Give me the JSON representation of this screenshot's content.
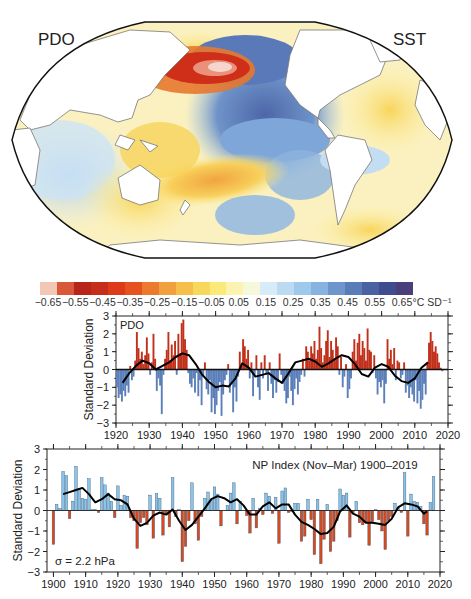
{
  "map": {
    "left_label": "PDO",
    "right_label": "SST",
    "projection": "Robinson-like world map, Pacific-centered"
  },
  "colorbar": {
    "ticks": [
      "-0.65",
      "-0.55",
      "-0.45",
      "-0.35",
      "-0.25",
      "-0.15",
      "-0.05",
      "0.05",
      "0.15",
      "0.25",
      "0.35",
      "0.45",
      "0.55",
      "0.65"
    ],
    "unit": "°C SD⁻¹",
    "colors": [
      "#f2c7b4",
      "#d9583a",
      "#b8231a",
      "#c42e1a",
      "#dd3a1a",
      "#e5511f",
      "#ec7a2e",
      "#f2a03f",
      "#f6bf4c",
      "#f8d85c",
      "#fbe97a",
      "#fcf3b0",
      "#f6f8dc",
      "#d8ebf8",
      "#bcdaf2",
      "#9ec8ec",
      "#86b3e0",
      "#6e96cc",
      "#5a7cb8",
      "#4a62a2",
      "#3f4d8e",
      "#4a3f7a"
    ]
  },
  "chart_data": [
    {
      "type": "bar",
      "title": "PDO",
      "xlabel": "",
      "ylabel": "Standard Deviation",
      "xlim": [
        1920,
        2020
      ],
      "ylim": [
        -3,
        3
      ],
      "xticks": [
        "1920",
        "1930",
        "1940",
        "1950",
        "1960",
        "1970",
        "1980",
        "1990",
        "2000",
        "2010",
        "2020"
      ],
      "yticks": [
        "-3",
        "-2",
        "-1",
        "0",
        "1",
        "2",
        "3"
      ],
      "positive_color": "#c0301a",
      "negative_color": "#5b7fb8",
      "note": "monthly bars approximated at ~quarterly resolution",
      "x": [
        1920.0,
        1920.5,
        1921.0,
        1921.5,
        1922.0,
        1922.5,
        1923.0,
        1923.5,
        1924.0,
        1924.5,
        1925.0,
        1925.5,
        1926.0,
        1926.5,
        1927.0,
        1927.5,
        1928.0,
        1928.5,
        1929.0,
        1929.5,
        1930.0,
        1930.5,
        1931.0,
        1931.5,
        1932.0,
        1932.5,
        1933.0,
        1933.5,
        1934.0,
        1934.5,
        1935.0,
        1935.5,
        1936.0,
        1936.5,
        1937.0,
        1937.5,
        1938.0,
        1938.5,
        1939.0,
        1939.5,
        1940.0,
        1940.5,
        1941.0,
        1941.5,
        1942.0,
        1942.5,
        1943.0,
        1943.5,
        1944.0,
        1944.5,
        1945.0,
        1945.5,
        1946.0,
        1946.5,
        1947.0,
        1947.5,
        1948.0,
        1948.5,
        1949.0,
        1949.5,
        1950.0,
        1950.5,
        1951.0,
        1951.5,
        1952.0,
        1952.5,
        1953.0,
        1953.5,
        1954.0,
        1954.5,
        1955.0,
        1955.5,
        1956.0,
        1956.5,
        1957.0,
        1957.5,
        1958.0,
        1958.5,
        1959.0,
        1959.5,
        1960.0,
        1960.5,
        1961.0,
        1961.5,
        1962.0,
        1962.5,
        1963.0,
        1963.5,
        1964.0,
        1964.5,
        1965.0,
        1965.5,
        1966.0,
        1966.5,
        1967.0,
        1967.5,
        1968.0,
        1968.5,
        1969.0,
        1969.5,
        1970.0,
        1970.5,
        1971.0,
        1971.5,
        1972.0,
        1972.5,
        1973.0,
        1973.5,
        1974.0,
        1974.5,
        1975.0,
        1975.5,
        1976.0,
        1976.5,
        1977.0,
        1977.5,
        1978.0,
        1978.5,
        1979.0,
        1979.5,
        1980.0,
        1980.5,
        1981.0,
        1981.5,
        1982.0,
        1982.5,
        1983.0,
        1983.5,
        1984.0,
        1984.5,
        1985.0,
        1985.5,
        1986.0,
        1986.5,
        1987.0,
        1987.5,
        1988.0,
        1988.5,
        1989.0,
        1989.5,
        1990.0,
        1990.5,
        1991.0,
        1991.5,
        1992.0,
        1992.5,
        1993.0,
        1993.5,
        1994.0,
        1994.5,
        1995.0,
        1995.5,
        1996.0,
        1996.5,
        1997.0,
        1997.5,
        1998.0,
        1998.5,
        1999.0,
        1999.5,
        2000.0,
        2000.5,
        2001.0,
        2001.5,
        2002.0,
        2002.5,
        2003.0,
        2003.5,
        2004.0,
        2004.5,
        2005.0,
        2005.5,
        2006.0,
        2006.5,
        2007.0,
        2007.5,
        2008.0,
        2008.5,
        2009.0,
        2009.5,
        2010.0,
        2010.5,
        2011.0,
        2011.5,
        2012.0,
        2012.5,
        2013.0,
        2013.5,
        2014.0,
        2014.5,
        2015.0,
        2015.5,
        2016.0,
        2016.5,
        2017.0,
        2017.5,
        2018.0,
        2018.5
      ],
      "values": [
        -1.0,
        -1.6,
        -1.4,
        -1.8,
        -1.2,
        -1.5,
        -0.9,
        -1.3,
        0.2,
        -0.6,
        -0.4,
        0.5,
        2.1,
        1.2,
        0.6,
        1.0,
        0.3,
        0.8,
        1.8,
        0.9,
        -0.3,
        0.4,
        2.0,
        0.6,
        -1.2,
        -0.5,
        -0.9,
        -2.5,
        -0.3,
        0.6,
        1.1,
        2.1,
        0.5,
        1.4,
        0.8,
        1.6,
        -0.3,
        2.0,
        0.9,
        2.6,
        2.8,
        1.7,
        1.1,
        -0.2,
        -0.8,
        -1.0,
        -0.5,
        -1.3,
        -0.2,
        -1.5,
        -0.6,
        -2.0,
        -0.4,
        0.4,
        -1.1,
        -1.4,
        -0.6,
        -2.4,
        -1.6,
        -2.5,
        -2.0,
        -1.2,
        -0.7,
        -2.6,
        -1.4,
        -0.6,
        -0.3,
        0.3,
        -1.3,
        -0.8,
        -2.4,
        -1.0,
        -1.8,
        -0.4,
        1.0,
        0.3,
        1.7,
        1.3,
        0.6,
        1.1,
        -0.5,
        0.4,
        -1.5,
        -0.3,
        0.8,
        -1.0,
        -1.7,
        0.4,
        -0.5,
        0.8,
        -0.3,
        -1.2,
        0.4,
        -0.8,
        -1.6,
        -0.6,
        -1.3,
        -0.7,
        0.9,
        -0.3,
        -0.8,
        -1.2,
        -1.9,
        -1.6,
        -0.4,
        -1.2,
        -2.0,
        -1.1,
        -0.5,
        -1.4,
        -0.7,
        -0.3,
        0.6,
        -0.4,
        1.3,
        1.0,
        0.5,
        1.3,
        0.9,
        1.6,
        0.6,
        1.1,
        2.4,
        1.2,
        0.4,
        0.8,
        1.6,
        2.2,
        0.7,
        1.6,
        1.1,
        0.6,
        1.8,
        1.3,
        -0.3,
        0.7,
        -1.0,
        -0.4,
        0.3,
        -1.6,
        -1.1,
        -0.5,
        1.0,
        1.7,
        0.5,
        1.5,
        2.0,
        0.8,
        1.6,
        1.2,
        0.5,
        2.3,
        1.1,
        1.0,
        -0.2,
        0.8,
        -0.5,
        -1.4,
        -0.7,
        -1.0,
        -0.6,
        -1.9,
        -0.8,
        1.7,
        0.6,
        1.1,
        0.3,
        1.2,
        -0.6,
        0.5,
        0.4,
        -0.5,
        -0.3,
        0.4,
        -1.3,
        -0.9,
        -1.6,
        -1.0,
        -1.4,
        -1.8,
        -0.6,
        -1.9,
        -1.2,
        -2.2,
        -1.7,
        -0.8,
        -1.4,
        0.4,
        1.5,
        2.1,
        1.6,
        1.0,
        1.3,
        0.9,
        0.4,
        0.1,
        -0.1
      ],
      "smooth": {
        "x": [
          1922,
          1924,
          1926,
          1928,
          1930,
          1932,
          1934,
          1936,
          1938,
          1940,
          1942,
          1944,
          1946,
          1948,
          1950,
          1952,
          1954,
          1956,
          1958,
          1960,
          1962,
          1964,
          1966,
          1968,
          1970,
          1972,
          1974,
          1976,
          1978,
          1980,
          1982,
          1984,
          1986,
          1988,
          1990,
          1992,
          1994,
          1996,
          1998,
          2000,
          2002,
          2004,
          2006,
          2008,
          2010,
          2012,
          2014
        ],
        "values": [
          -0.75,
          -0.2,
          0.2,
          0.5,
          0.35,
          0.0,
          0.2,
          0.4,
          0.7,
          0.9,
          0.8,
          0.3,
          -0.3,
          -0.7,
          -1.0,
          -0.9,
          -0.95,
          -0.5,
          0.35,
          0.1,
          -0.4,
          -0.3,
          -0.2,
          -0.5,
          -0.75,
          -0.2,
          0.4,
          0.5,
          0.6,
          0.45,
          0.15,
          0.35,
          0.6,
          0.8,
          0.7,
          0.3,
          -0.25,
          -0.4,
          0.1,
          0.3,
          0.15,
          -0.35,
          -0.65,
          -0.75,
          -0.5,
          0.1,
          0.4
        ]
      }
    },
    {
      "type": "bar",
      "title": "NP Index (Nov-Mar) 1900-2019",
      "xlabel": "",
      "ylabel": "Standard Deviation",
      "annotation": "σ = 2.2 hPa",
      "xlim": [
        1898,
        2020
      ],
      "ylim": [
        -3,
        3
      ],
      "xticks": [
        "1900",
        "1910",
        "1920",
        "1930",
        "1940",
        "1950",
        "1960",
        "1970",
        "1980",
        "1990",
        "2000",
        "2010",
        "2020"
      ],
      "yticks": [
        "-3",
        "-2",
        "-1",
        "0",
        "1",
        "2",
        "3"
      ],
      "positive_color": "#8cc3e8",
      "negative_color": "#d9491c",
      "x": [
        1900,
        1901,
        1902,
        1903,
        1904,
        1905,
        1906,
        1907,
        1908,
        1909,
        1910,
        1911,
        1912,
        1913,
        1914,
        1915,
        1916,
        1917,
        1918,
        1919,
        1920,
        1921,
        1922,
        1923,
        1924,
        1925,
        1926,
        1927,
        1928,
        1929,
        1930,
        1931,
        1932,
        1933,
        1934,
        1935,
        1936,
        1937,
        1938,
        1939,
        1940,
        1941,
        1942,
        1943,
        1944,
        1945,
        1946,
        1947,
        1948,
        1949,
        1950,
        1951,
        1952,
        1953,
        1954,
        1955,
        1956,
        1957,
        1958,
        1959,
        1960,
        1961,
        1962,
        1963,
        1964,
        1965,
        1966,
        1967,
        1968,
        1969,
        1970,
        1971,
        1972,
        1973,
        1974,
        1975,
        1976,
        1977,
        1978,
        1979,
        1980,
        1981,
        1982,
        1983,
        1984,
        1985,
        1986,
        1987,
        1988,
        1989,
        1990,
        1991,
        1992,
        1993,
        1994,
        1995,
        1996,
        1997,
        1998,
        1999,
        2000,
        2001,
        2002,
        2003,
        2004,
        2005,
        2006,
        2007,
        2008,
        2009,
        2010,
        2011,
        2012,
        2013,
        2014,
        2015,
        2016,
        2017,
        2018,
        2019
      ],
      "values": [
        -1.65,
        0.3,
        0.1,
        1.9,
        1.7,
        -0.4,
        0.45,
        2.15,
        1.05,
        0.6,
        0.55,
        1.55,
        0.05,
        0.05,
        -0.1,
        1.6,
        1.25,
        0.85,
        0.45,
        -0.35,
        1.2,
        0.25,
        0.75,
        0.7,
        -0.35,
        -0.5,
        -1.85,
        -0.6,
        -0.35,
        -0.7,
        0.75,
        -1.35,
        0.82,
        0.6,
        -1.2,
        -0.15,
        -0.8,
        1.6,
        -0.3,
        0.05,
        -2.5,
        -1.75,
        -0.5,
        1.35,
        -0.65,
        -1.45,
        -0.3,
        0.6,
        0.9,
        0.5,
        1.15,
        0.8,
        -0.75,
        0.0,
        0.25,
        0.85,
        1.35,
        -0.65,
        0.45,
        0.0,
        -0.25,
        -1.1,
        0.6,
        -0.85,
        0.1,
        -0.2,
        0.85,
        0.7,
        -0.15,
        0.65,
        -1.6,
        0.95,
        1.1,
        -0.1,
        -0.05,
        0.35,
        0.35,
        -1.5,
        -1.25,
        0.55,
        -0.45,
        -2.15,
        0.55,
        -2.6,
        -1.4,
        0.3,
        -2.0,
        -1.5,
        -0.5,
        1.05,
        0.75,
        0.85,
        -1.3,
        -0.1,
        0.45,
        -0.6,
        -0.7,
        -0.6,
        -1.7,
        -0.55,
        0.05,
        -0.45,
        -1.0,
        -1.9,
        -0.5,
        -0.3,
        0.35,
        0.1,
        -0.1,
        1.85,
        -1.25,
        0.8,
        0.45,
        0.4,
        0.2,
        -0.65,
        -1.2,
        0.4,
        1.65,
        0.0
      ],
      "smooth": {
        "x": [
          1903,
          1905,
          1907,
          1909,
          1911,
          1913,
          1915,
          1917,
          1919,
          1921,
          1923,
          1925,
          1927,
          1929,
          1931,
          1933,
          1935,
          1937,
          1939,
          1941,
          1943,
          1945,
          1947,
          1949,
          1951,
          1953,
          1955,
          1957,
          1959,
          1961,
          1963,
          1965,
          1967,
          1969,
          1971,
          1973,
          1975,
          1977,
          1979,
          1981,
          1983,
          1985,
          1987,
          1989,
          1991,
          1993,
          1995,
          1997,
          1999,
          2001,
          2003,
          2005,
          2007,
          2009,
          2011,
          2013,
          2015,
          2016
        ],
        "values": [
          0.8,
          0.9,
          1.0,
          1.1,
          0.8,
          0.4,
          0.55,
          0.8,
          0.55,
          0.5,
          0.3,
          -0.4,
          -0.75,
          -0.6,
          -0.25,
          -0.1,
          -0.2,
          0.05,
          -0.5,
          -0.95,
          -0.7,
          -0.3,
          0.1,
          0.55,
          0.7,
          0.6,
          0.4,
          0.55,
          0.25,
          -0.2,
          -0.2,
          0.2,
          0.4,
          0.1,
          0.3,
          0.3,
          -0.2,
          -0.55,
          -0.7,
          -0.9,
          -1.15,
          -1.1,
          -0.8,
          -0.05,
          0.25,
          -0.15,
          -0.3,
          -0.6,
          -0.6,
          -0.65,
          -0.7,
          -0.4,
          0.15,
          0.35,
          0.3,
          0.2,
          -0.15,
          -0.05
        ]
      }
    }
  ]
}
